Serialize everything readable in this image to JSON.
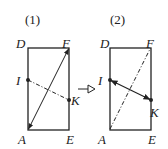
{
  "figures": [
    {
      "id": "fig1",
      "caption": "(1)",
      "labels": {
        "D": "D",
        "F": "F",
        "I": "I",
        "K": "K",
        "A": "A",
        "E": "E"
      },
      "solid_arrow": "A↔F",
      "dashed_line": "I–K"
    },
    {
      "id": "fig2",
      "caption": "(2)",
      "labels": {
        "D": "D",
        "F": "F",
        "I": "I",
        "K": "K",
        "A": "A",
        "E": "E"
      },
      "solid_arrow": "I↔K",
      "dashed_line": "A–F"
    }
  ],
  "transition_arrow": "hollow-right-arrow",
  "colors": {
    "stroke": "#222222",
    "background": "#ffffff"
  }
}
